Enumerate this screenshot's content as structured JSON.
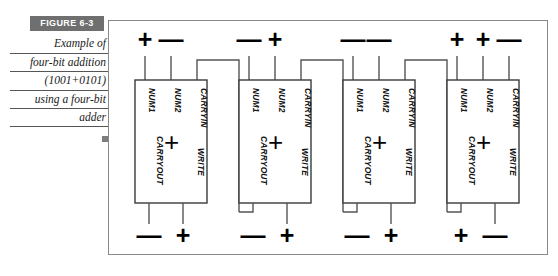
{
  "figure": {
    "label": "FIGURE  6-3",
    "caption_lines": [
      "Example of",
      "four-bit addition",
      "(1001+0101)",
      "using a four-bit",
      "adder"
    ],
    "end_marker": "square-marker"
  },
  "colors": {
    "label_background": "#6f6f6f",
    "label_text": "#ffffff",
    "frame_border": "#8a8a8a",
    "wire": "#555555",
    "block_border": "#3a3a3a",
    "ink": "#000000",
    "end_marker": "#7d7d7d"
  },
  "diagram": {
    "type": "four-bit-ripple-carry-adder",
    "operand_a": "1001",
    "operand_b": "0101",
    "port_names": {
      "num1": "NUM1",
      "num2": "NUM2",
      "carryin": "CARRYIN",
      "carryout": "CARRYOUT",
      "write": "WRITE",
      "operator": "+"
    },
    "signal_symbols": {
      "high": "+",
      "low": "—"
    },
    "blocks": [
      {
        "index": 0,
        "position": "bit-3-msb",
        "top_signals": [
          {
            "port": "NUM1",
            "symbol": "+"
          },
          {
            "port": "NUM2",
            "symbol": "—"
          }
        ],
        "bottom_signals": [
          {
            "port": "CARRYOUT",
            "symbol": "—"
          },
          {
            "port": "WRITE",
            "symbol": "+"
          }
        ],
        "carryin_source": "block-1-carryout"
      },
      {
        "index": 1,
        "position": "bit-2",
        "top_signals": [
          {
            "port": "NUM1",
            "symbol": "—"
          },
          {
            "port": "NUM2",
            "symbol": "+"
          }
        ],
        "bottom_signals": [
          {
            "port": "CARRYOUT",
            "symbol": "—"
          },
          {
            "port": "WRITE",
            "symbol": "+"
          }
        ],
        "carryin_source": "block-2-carryout"
      },
      {
        "index": 2,
        "position": "bit-1",
        "top_signals": [
          {
            "port": "NUM1",
            "symbol": "—"
          },
          {
            "port": "NUM2",
            "symbol": "—"
          }
        ],
        "bottom_signals": [
          {
            "port": "CARRYOUT",
            "symbol": "—"
          },
          {
            "port": "WRITE",
            "symbol": "+"
          }
        ],
        "carryin_source": "block-3-carryout"
      },
      {
        "index": 3,
        "position": "bit-0-lsb",
        "top_signals": [
          {
            "port": "NUM1",
            "symbol": "+"
          },
          {
            "port": "NUM2",
            "symbol": "+"
          },
          {
            "port": "CARRYIN",
            "symbol": "—"
          }
        ],
        "bottom_signals": [
          {
            "port": "CARRYOUT",
            "symbol": "+"
          },
          {
            "port": "WRITE",
            "symbol": "—"
          }
        ],
        "carryin_source": "external-low"
      }
    ],
    "top_row_symbols": [
      "+",
      "—",
      "—",
      "+",
      "—",
      "—",
      "+",
      "+",
      "—"
    ],
    "bottom_row_symbols": [
      "—",
      "+",
      "—",
      "+",
      "—",
      "+",
      "+",
      "—"
    ]
  }
}
